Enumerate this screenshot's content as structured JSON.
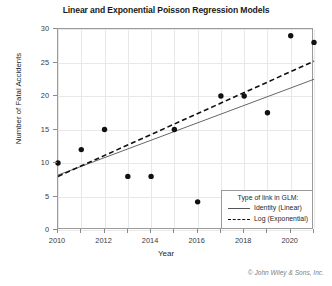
{
  "chart_data": {
    "type": "scatter",
    "title": "Linear and Exponential Poisson Regression Models",
    "xlabel": "Year",
    "ylabel": "Number of Fatal Accidents",
    "xlim": [
      2010,
      2021
    ],
    "ylim": [
      0,
      30
    ],
    "xticks": [
      2010,
      2012,
      2014,
      2016,
      2018,
      2020
    ],
    "xtick_labels": [
      "2010",
      "2012",
      "2014",
      "2016",
      "2018",
      "2020"
    ],
    "yticks": [
      0,
      5,
      10,
      15,
      20,
      25,
      30
    ],
    "ytick_labels": [
      "0",
      "5",
      "10",
      "15",
      "20",
      "25",
      "30"
    ],
    "grid": true,
    "legend_position": "bottom-right",
    "x": [
      2010,
      2011,
      2012,
      2013,
      2014,
      2015,
      2016,
      2017,
      2018,
      2019,
      2020,
      2021
    ],
    "values": [
      10,
      12,
      15,
      8,
      8,
      15,
      4.2,
      20,
      20,
      17.5,
      29,
      28
    ],
    "marker": "filled-circle",
    "marker_color": "#111111",
    "series": [
      {
        "name": "Identity (Linear)",
        "style": "solid",
        "color": "#555555",
        "fit_endpoints": [
          {
            "x": 2010,
            "y": 8.2
          },
          {
            "x": 2021,
            "y": 22.5
          }
        ]
      },
      {
        "name": "Log (Exponential)",
        "style": "dashed",
        "color": "#111111",
        "fit_endpoints": [
          {
            "x": 2010,
            "y": 8.0
          },
          {
            "x": 2021,
            "y": 25.2
          }
        ]
      }
    ]
  },
  "legend": {
    "title": "Type of link in GLM:",
    "items": [
      {
        "label": "Identity (Linear)",
        "style": "solid"
      },
      {
        "label": "Log (Exponential)",
        "style": "dashed"
      }
    ]
  },
  "credit": "© John Wiley & Sons, Inc."
}
